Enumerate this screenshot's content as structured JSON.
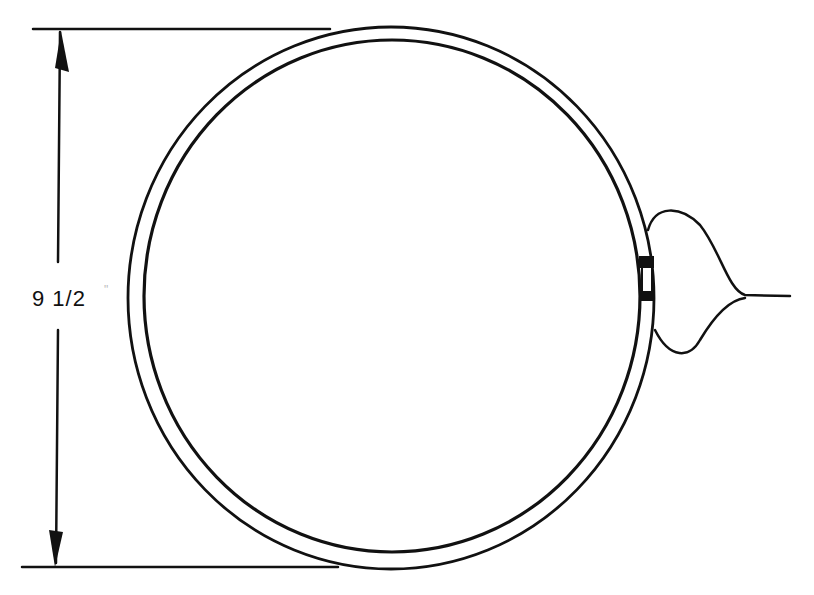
{
  "diagram": {
    "dimension": {
      "label": "9 1/2",
      "unit_mark": "\"",
      "orientation": "vertical"
    },
    "colors": {
      "line": "#111111",
      "background": "#ffffff"
    }
  }
}
